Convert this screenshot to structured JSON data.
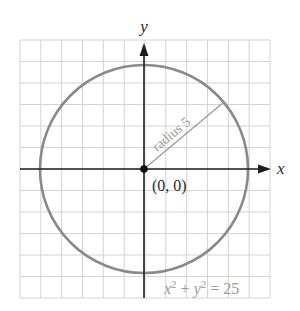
{
  "figure": {
    "axes": {
      "x_label": "x",
      "y_label": "y",
      "x_range": [
        -6,
        6
      ],
      "y_range": [
        -6,
        6
      ],
      "grid_step": 1
    },
    "circle": {
      "center": [
        0,
        0
      ],
      "radius": 5
    },
    "labels": {
      "origin": "(0, 0)",
      "radius": "radius 5",
      "equation_x": "x",
      "equation_exp1": "2",
      "equation_plus": " + ",
      "equation_y": "y",
      "equation_exp2": "2",
      "equation_rhs": " = 25"
    },
    "colors": {
      "background": "#ffffff",
      "grid": "#d4d4d4",
      "axes": "#1e1e1e",
      "circle": "#8a8a8a",
      "radius_line": "#9a9a9a",
      "annotation_text": "#9a9a9a",
      "label_text": "#2a2a2a"
    }
  }
}
